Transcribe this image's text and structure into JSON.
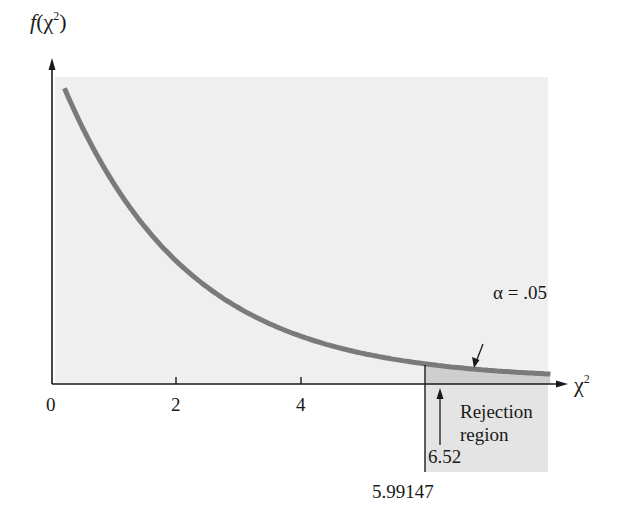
{
  "chart_data": {
    "type": "line",
    "title": "",
    "xlabel": "χ²",
    "ylabel": "f(χ²)",
    "distribution": "chi-square, df = 2",
    "x_ticks": [
      0,
      2,
      4
    ],
    "x_range": [
      0,
      8
    ],
    "series": [
      {
        "name": "f(χ²)",
        "x": [
          0.2,
          0.5,
          1,
          1.5,
          2,
          2.5,
          3,
          3.5,
          4,
          4.5,
          5,
          5.5,
          5.99147,
          6.5,
          7,
          7.5,
          8
        ],
        "values": [
          0.452,
          0.389,
          0.303,
          0.236,
          0.184,
          0.143,
          0.112,
          0.087,
          0.068,
          0.053,
          0.041,
          0.032,
          0.025,
          0.019,
          0.015,
          0.012,
          0.009
        ]
      }
    ],
    "shaded_region": {
      "from": 5.99147,
      "to": 8,
      "label": "Rejection region",
      "area": 0.05
    },
    "annotations": [
      {
        "text": "α = .05",
        "points_to": "tail area"
      },
      {
        "text": "6.52",
        "x": 6.52,
        "type": "arrow",
        "meaning": "observed test statistic"
      },
      {
        "text": "5.99147",
        "x": 5.99147,
        "type": "vertical line",
        "meaning": "critical value"
      },
      {
        "text": "Rejection region",
        "x": 7
      }
    ],
    "grid": false,
    "legend": "none"
  },
  "labels": {
    "y_axis": {
      "f": "f",
      "open": "(χ",
      "sup": "2",
      "close": ")"
    },
    "x_axis": {
      "base": "χ",
      "sup": "2"
    },
    "ticks": [
      "0",
      "2",
      "4"
    ],
    "alpha": "α = .05",
    "rejection_line1": "Rejection",
    "rejection_line2": "region",
    "observed": "6.52",
    "critical": "5.99147"
  },
  "colors": {
    "panel": "#efefef",
    "rejection": "#d9d9d9",
    "curve": "#7a7a7a",
    "axis": "#1a1a1a"
  }
}
